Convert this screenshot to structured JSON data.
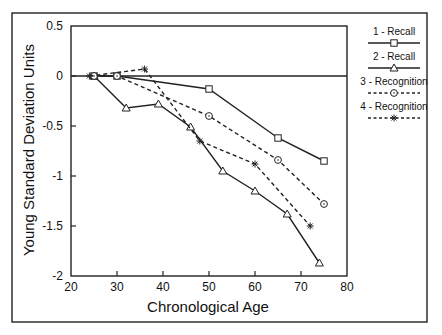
{
  "chart_data": {
    "type": "line",
    "title": "",
    "xlabel": "Chronological Age",
    "ylabel": "Young Standard Deviation Units",
    "xlim": [
      20,
      80
    ],
    "ylim": [
      -2,
      0.5
    ],
    "x_ticks": [
      20,
      30,
      40,
      50,
      60,
      70,
      80
    ],
    "y_ticks": [
      0.5,
      0,
      -0.5,
      -1,
      -1.5,
      -2
    ],
    "grid": false,
    "reference_line_y": 0,
    "legend_position": "right, outside plot",
    "series": [
      {
        "name": "1 - Recall",
        "line_style": "solid",
        "marker": "square",
        "x": [
          25,
          30,
          50,
          65,
          75
        ],
        "y": [
          0,
          0,
          -0.13,
          -0.62,
          -0.85
        ]
      },
      {
        "name": "2 - Recall",
        "line_style": "solid",
        "marker": "triangle",
        "x": [
          25,
          32,
          39,
          46,
          53,
          60,
          67,
          74
        ],
        "y": [
          0,
          -0.32,
          -0.28,
          -0.51,
          -0.95,
          -1.15,
          -1.38,
          -1.87
        ]
      },
      {
        "name": "3 - Recognition",
        "line_style": "dashed",
        "marker": "circle",
        "x": [
          25,
          30,
          50,
          65,
          75
        ],
        "y": [
          0,
          0,
          -0.4,
          -0.84,
          -1.28
        ]
      },
      {
        "name": "4 - Recognition",
        "line_style": "dashed",
        "marker": "star",
        "x": [
          24,
          36,
          48,
          60,
          72
        ],
        "y": [
          0,
          0.07,
          -0.65,
          -0.88,
          -1.5
        ]
      }
    ]
  }
}
